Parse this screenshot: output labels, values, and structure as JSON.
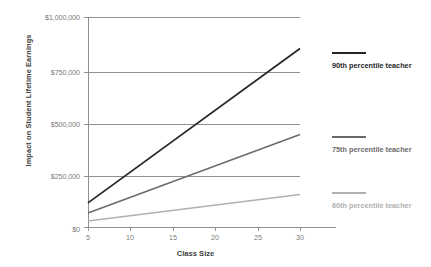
{
  "chart_data": {
    "type": "line",
    "title": "",
    "xlabel": "Class Size",
    "ylabel": "Impact on Student Lifetime Earnings",
    "x": [
      5,
      30
    ],
    "xlim": [
      5,
      30
    ],
    "ylim": [
      0,
      1000000
    ],
    "xticks": [
      "5",
      "10",
      "15",
      "20",
      "25",
      "30"
    ],
    "xtick_values": [
      5,
      10,
      15,
      20,
      25,
      30
    ],
    "yticks": [
      "$0",
      "$250,000",
      "$500,000",
      "$750,000",
      "$1,000,000"
    ],
    "ytick_values": [
      0,
      250000,
      500000,
      750000,
      1000000
    ],
    "grid": "horizontal",
    "legend_position": "right",
    "series": [
      {
        "name": "90th percentile teacher",
        "color": "#262626",
        "values": [
          115000,
          850000
        ],
        "legend_label": "90th percentile teacher"
      },
      {
        "name": "75th percentile teacher",
        "color": "#6b6b6b",
        "values": [
          67000,
          440000
        ],
        "legend_label": "75th percentile teacher"
      },
      {
        "name": "60th percentile teacher",
        "color": "#b0b0b0",
        "values": [
          29000,
          155000
        ],
        "legend_label": "60th percentile teacher"
      }
    ]
  }
}
